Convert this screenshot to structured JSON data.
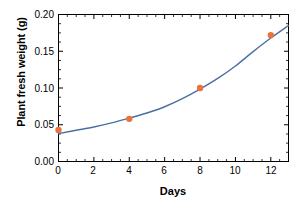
{
  "chart_data": {
    "type": "scatter",
    "title": "",
    "subtitle": "",
    "xlabel": "Days",
    "ylabel": "Plant fresh weight (g)",
    "xlim": [
      0,
      13
    ],
    "ylim": [
      0,
      0.2
    ],
    "grid": false,
    "legend": null,
    "x_ticks": [
      "0",
      "2",
      "4",
      "6",
      "8",
      "10",
      "12"
    ],
    "x_tick_values": [
      0,
      2,
      4,
      6,
      8,
      10,
      12
    ],
    "x_minor_tick_interval": 0.5,
    "y_ticks": [
      "0.00",
      "0.05",
      "0.10",
      "0.15",
      "0.20"
    ],
    "y_tick_values": [
      0.0,
      0.05,
      0.1,
      0.15,
      0.2
    ],
    "y_minor_tick_interval": 0.0125,
    "series": [
      {
        "name": "Measured plant fresh weight",
        "type": "scatter",
        "marker": "circle",
        "color": "#E8743B",
        "x": [
          0,
          4,
          8,
          12
        ],
        "values": [
          0.043,
          0.058,
          0.1,
          0.172
        ]
      },
      {
        "name": "Fitted exponential growth curve",
        "type": "line",
        "color": "#4A6FA5",
        "x": [
          0,
          1,
          2,
          3,
          4,
          5,
          6,
          7,
          8,
          9,
          10,
          11,
          12,
          13
        ],
        "values": [
          0.038,
          0.0425,
          0.047,
          0.0525,
          0.059,
          0.066,
          0.0745,
          0.0855,
          0.0985,
          0.113,
          0.13,
          0.1495,
          0.168,
          0.185
        ]
      }
    ],
    "colors": {
      "marker": "#E8743B",
      "line": "#4A6FA5",
      "axis": "#000000",
      "background": "#FFFFFF"
    }
  }
}
